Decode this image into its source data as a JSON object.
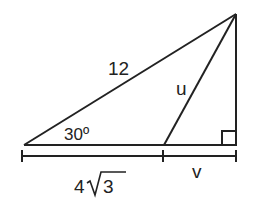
{
  "diagram": {
    "type": "right-triangle-geometry",
    "labels": {
      "hypotenuse": "12",
      "inner_segment": "u",
      "angle": "30º",
      "base_left": "4",
      "base_left_radicand": "3",
      "base_right": "v"
    },
    "colors": {
      "stroke": "#222222",
      "background": "#ffffff"
    }
  }
}
